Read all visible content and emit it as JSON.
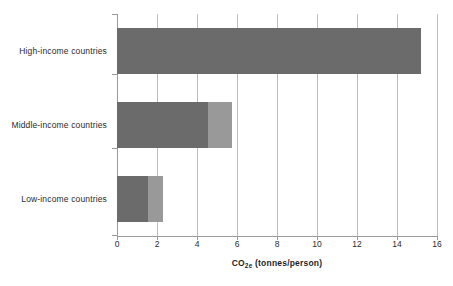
{
  "chart_data": {
    "type": "bar",
    "orientation": "horizontal",
    "stacked": true,
    "title": "",
    "xlabel": "CO2e (tonnes/person)",
    "xlabel_parts": {
      "prefix": "CO",
      "sub": "2e",
      "suffix": " (tonnes/person)"
    },
    "ylabel": "",
    "categories": [
      "High-income countries",
      "Middle-income countries",
      "Low-income countries"
    ],
    "series": [
      {
        "name": "segment-1",
        "color": "#6b6b6b",
        "values": [
          15.2,
          4.55,
          1.55
        ]
      },
      {
        "name": "segment-2",
        "color": "#999999",
        "values": [
          0,
          1.2,
          0.75
        ]
      }
    ],
    "totals": [
      15.2,
      5.75,
      2.3
    ],
    "xlim": [
      0,
      16
    ],
    "xticks": [
      0,
      2,
      4,
      6,
      8,
      10,
      12,
      14,
      16
    ],
    "xtick_labels": [
      "0",
      "2",
      "4",
      "6",
      "8",
      "10",
      "12",
      "14",
      "16"
    ],
    "grid": {
      "vertical": true,
      "horizontal": false,
      "color": "#bdbdbd"
    },
    "legend": {
      "visible": false,
      "position": "none"
    },
    "background": "#ffffff",
    "axis_color": "#9a9a9a",
    "text_color": "#2b2b2b"
  }
}
